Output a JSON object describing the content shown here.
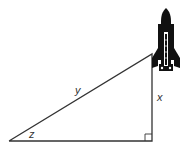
{
  "diagram": {
    "type": "right-triangle",
    "labels": {
      "hypotenuse": "y",
      "vertical_side": "x",
      "angle": "z"
    },
    "icon": "space-shuttle-icon",
    "colors": {
      "line": "#333333",
      "shuttle": "#111111",
      "background": "#ffffff"
    }
  }
}
